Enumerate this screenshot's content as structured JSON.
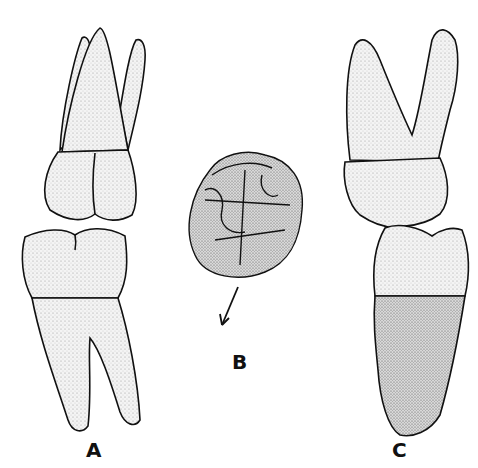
{
  "figure": {
    "panels": [
      {
        "id": "A",
        "label": "A",
        "description": "Upper and lower molars in occlusion, buccal view"
      },
      {
        "id": "B",
        "label": "B",
        "description": "Occlusal view of molar with arrow"
      },
      {
        "id": "C",
        "label": "C",
        "description": "Upper and lower teeth in occlusion, lateral view"
      }
    ],
    "colors": {
      "ink": "#111111",
      "background": "#ffffff",
      "stipple": "#9a9a9a"
    }
  }
}
